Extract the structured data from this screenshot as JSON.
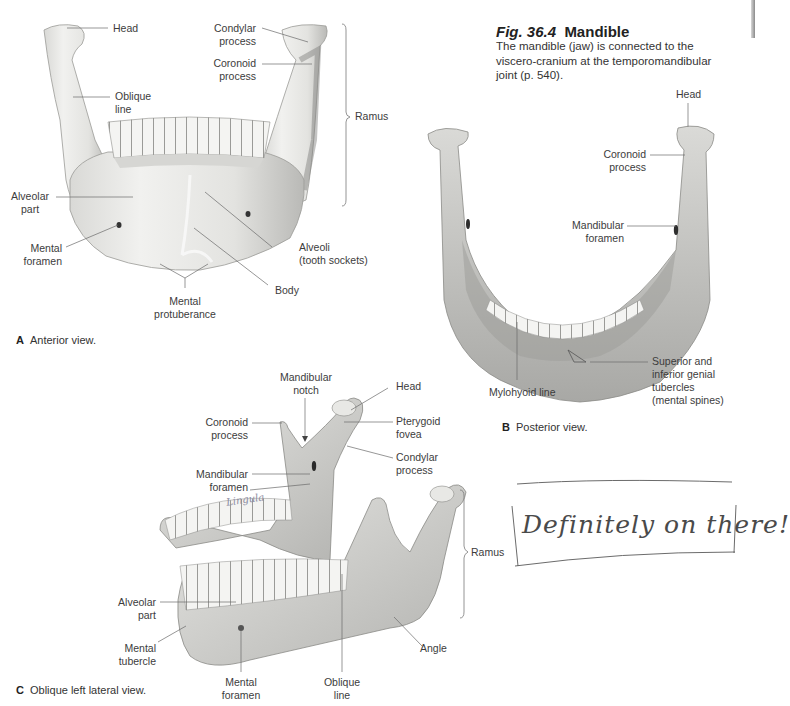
{
  "figure": {
    "number": "Fig. 36.4",
    "title": "Mandible",
    "description": "The mandible (jaw) is connected to the viscero-cranium at the temporomandibular joint (p. 540)."
  },
  "panels": {
    "A": {
      "letter": "A",
      "caption": "Anterior view.",
      "labels": {
        "head": "Head",
        "oblique_line": [
          "Oblique",
          "line"
        ],
        "condylar_process": [
          "Condylar",
          "process"
        ],
        "coronoid_process": [
          "Coronoid",
          "process"
        ],
        "ramus": "Ramus",
        "alveolar_part": [
          "Alveolar",
          "part"
        ],
        "mental_foramen": [
          "Mental",
          "foramen"
        ],
        "alveoli": [
          "Alveoli",
          "(tooth sockets)"
        ],
        "body": "Body",
        "mental_protuberance": [
          "Mental",
          "protuberance"
        ]
      }
    },
    "B": {
      "letter": "B",
      "caption": "Posterior view.",
      "labels": {
        "head": "Head",
        "coronoid_process": [
          "Coronoid",
          "process"
        ],
        "mandibular_foramen": [
          "Mandibular",
          "foramen"
        ],
        "mylohyoid_line": "Mylohyoid line",
        "genial_tubercles": [
          "Superior and",
          "inferior genial",
          "tubercles",
          "(mental spines)"
        ]
      }
    },
    "C": {
      "letter": "C",
      "caption": "Oblique left lateral view.",
      "labels": {
        "mandibular_notch": [
          "Mandibular",
          "notch"
        ],
        "head": "Head",
        "coronoid_process": [
          "Coronoid",
          "process"
        ],
        "pterygoid_fovea": [
          "Pterygoid",
          "fovea"
        ],
        "condylar_process": [
          "Condylar",
          "process"
        ],
        "mandibular_foramen": [
          "Mandibular",
          "foramen"
        ],
        "ramus": "Ramus",
        "alveolar_part": [
          "Alveolar",
          "part"
        ],
        "mental_tubercle": [
          "Mental",
          "tubercle"
        ],
        "mental_foramen": [
          "Mental",
          "foramen"
        ],
        "oblique_line": [
          "Oblique",
          "line"
        ],
        "angle": "Angle"
      }
    }
  },
  "handwritten_notes": {
    "lingula": "Lingula",
    "boxed_note": "Definitely on there!"
  },
  "colors": {
    "bone_light": "#ececea",
    "bone_mid": "#c9c9c6",
    "bone_dark": "#8f8f8c",
    "leader_line": "#6a6a6a",
    "ink": "#555555"
  }
}
